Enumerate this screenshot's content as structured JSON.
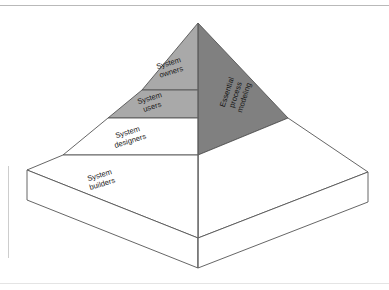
{
  "figure": {
    "frame": {
      "top_rule_color": "#b9b9b9",
      "bottom_rule_color": "#e2e2e2",
      "left_rule_color": "#c9c9c9"
    },
    "colors": {
      "shade_left_face": "#a9a9a9",
      "shade_right_face": "#808080",
      "unshaded_face": "#ffffff",
      "outline": "#555555",
      "text": "#1a1a1a",
      "background": "#ffffff"
    },
    "tiers": [
      {
        "id": "system-owners",
        "line1": "System",
        "line2": "owners",
        "shaded": true
      },
      {
        "id": "system-users",
        "line1": "System",
        "line2": "users",
        "shaded": true
      },
      {
        "id": "system-designers",
        "line1": "System",
        "line2": "designers",
        "shaded": false
      },
      {
        "id": "system-builders",
        "line1": "System",
        "line2": "builders",
        "shaded": false
      }
    ],
    "side_label": {
      "id": "essential-process-modeling",
      "line1": "Essential",
      "line2": "process",
      "line3": "modeling"
    }
  }
}
